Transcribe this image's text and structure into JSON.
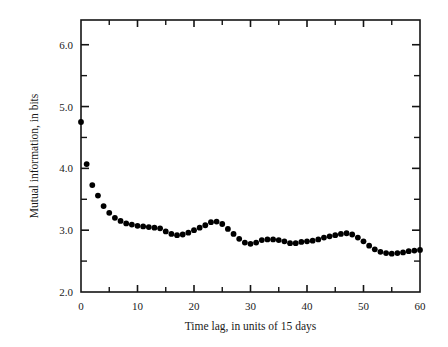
{
  "chart_data": {
    "type": "scatter",
    "title": "",
    "xlabel": "Time lag, in units of 15 days",
    "ylabel": "Mutual information, in bits",
    "xlim": [
      0,
      60
    ],
    "ylim": [
      2.0,
      6.4
    ],
    "grid": false,
    "legend": null,
    "marker": "filled-circle",
    "marker_color": "#000000",
    "xticks_major": [
      0,
      10,
      20,
      30,
      40,
      50,
      60
    ],
    "xticks_major_labels": [
      "0",
      "10",
      "20",
      "30",
      "40",
      "50",
      "60"
    ],
    "xticks_minor": [
      5,
      15,
      25,
      35,
      45,
      55
    ],
    "yticks_major": [
      2.0,
      3.0,
      4.0,
      5.0,
      6.0
    ],
    "yticks_major_labels": [
      "2.0",
      "3.0",
      "4.0",
      "5.0",
      "6.0"
    ],
    "yticks_minor": [
      2.5,
      3.5,
      4.5,
      5.5
    ],
    "x": [
      0,
      1,
      2,
      3,
      4,
      5,
      6,
      7,
      8,
      9,
      10,
      11,
      12,
      13,
      14,
      15,
      16,
      17,
      18,
      19,
      20,
      21,
      22,
      23,
      24,
      25,
      26,
      27,
      28,
      29,
      30,
      31,
      32,
      33,
      34,
      35,
      36,
      37,
      38,
      39,
      40,
      41,
      42,
      43,
      44,
      45,
      46,
      47,
      48,
      49,
      50,
      51,
      52,
      53,
      54,
      55,
      56,
      57,
      58,
      59,
      60
    ],
    "y": [
      4.75,
      4.07,
      3.73,
      3.56,
      3.39,
      3.28,
      3.2,
      3.15,
      3.11,
      3.09,
      3.07,
      3.06,
      3.05,
      3.04,
      3.03,
      2.98,
      2.94,
      2.92,
      2.93,
      2.96,
      3.0,
      3.04,
      3.08,
      3.13,
      3.14,
      3.1,
      3.02,
      2.94,
      2.86,
      2.8,
      2.78,
      2.8,
      2.84,
      2.85,
      2.85,
      2.84,
      2.82,
      2.79,
      2.79,
      2.81,
      2.82,
      2.83,
      2.85,
      2.88,
      2.9,
      2.92,
      2.94,
      2.95,
      2.93,
      2.88,
      2.82,
      2.75,
      2.69,
      2.65,
      2.63,
      2.62,
      2.63,
      2.64,
      2.66,
      2.67,
      2.68
    ]
  },
  "axes": {
    "y_axis_title": "Mutual information, in bits",
    "x_axis_title": "Time lag, in units of 15 days"
  }
}
